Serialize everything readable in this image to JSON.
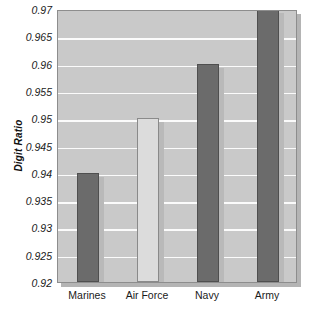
{
  "chart_data": {
    "type": "bar",
    "title": "",
    "subtitle": "",
    "xlabel": "",
    "ylabel": "Digit Ratio",
    "categories": [
      "Marines",
      "Air Force",
      "Navy",
      "Army"
    ],
    "values": [
      0.94,
      0.95,
      0.96,
      0.971
    ],
    "series": [
      {
        "name": "Digit Ratio",
        "values": [
          0.94,
          0.95,
          0.96,
          0.971
        ]
      }
    ],
    "bar_colors": [
      "#6b6b6b",
      "#dcdcdc",
      "#6b6b6b",
      "#6b6b6b"
    ],
    "bar_styles": [
      "dark",
      "light",
      "dark",
      "dark"
    ],
    "clipped_bars": [
      false,
      false,
      false,
      true
    ],
    "ylim": [
      0.92,
      0.97
    ],
    "ytick_labels": [
      "0.97",
      "0.965",
      "0.96",
      "0.955",
      "0.95",
      "0.945",
      "0.94",
      "0.935",
      "0.93",
      "0.925",
      "0.92"
    ],
    "ytick_values": [
      0.97,
      0.965,
      0.96,
      0.955,
      0.95,
      0.945,
      0.94,
      0.935,
      0.93,
      0.925,
      0.92
    ],
    "ytick_step": 0.005,
    "grid": true,
    "grid_axis": "y",
    "grid_color": "#fbfbfb",
    "legend": false,
    "legend_position": "none",
    "plot_background": "#c9c9c9",
    "plot_border_color": "#8d8d8d",
    "figure_background": "#ffffff",
    "annotations": []
  }
}
